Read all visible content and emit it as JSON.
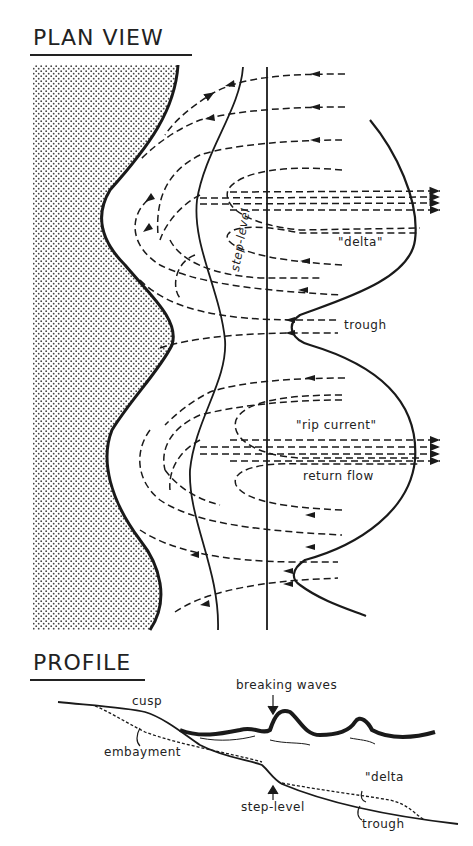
{
  "plan_view": {
    "title": "PLAN VIEW",
    "labels": {
      "step_level": "step-level",
      "delta": "\"delta\"",
      "trough": "trough",
      "rip_current": "\"rip current\"",
      "return_flow": "return flow"
    }
  },
  "profile": {
    "title": "PROFILE",
    "labels": {
      "breaking_waves": "breaking waves",
      "cusp": "cusp",
      "embayment": "embayment",
      "step_level": "step-level",
      "delta": "\"delta",
      "trough": "trough"
    }
  },
  "colors": {
    "ink": "#1a1a1a",
    "beach_stipple": "#555555",
    "background": "#ffffff"
  }
}
